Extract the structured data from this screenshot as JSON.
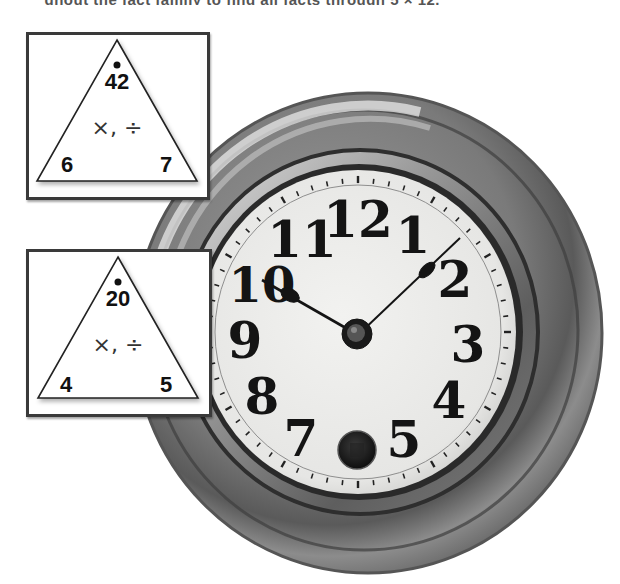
{
  "caption": {
    "clipped_text": "ghout the fact family to find all facts through 5 × 12."
  },
  "fact_triangles": [
    {
      "top": "42",
      "bottom_left": "6",
      "bottom_right": "7",
      "operations": "×, ÷"
    },
    {
      "top": "20",
      "bottom_left": "4",
      "bottom_right": "5",
      "operations": "×, ÷"
    }
  ],
  "clock": {
    "numerals": [
      "12",
      "1",
      "2",
      "3",
      "4",
      "5",
      "6",
      "7",
      "8",
      "9",
      "10",
      "11"
    ],
    "hour_hand_points_to": "10",
    "minute_hand_points_to": "2",
    "time_shown": "10:09",
    "colors": {
      "case_dark": "#4a4a4a",
      "case_mid": "#8a8a8a",
      "case_light": "#cfcfcf",
      "dial_face": "#ececea",
      "ink": "#141414"
    }
  }
}
